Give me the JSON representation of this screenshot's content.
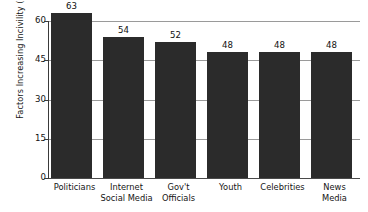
{
  "chart_data": {
    "type": "bar",
    "title": "",
    "subtitle": "",
    "xlabel": "",
    "ylabel": "Factors Increasing Incivility (%)",
    "categories": [
      "Politicians",
      "Internet Social Media",
      "Gov't Officials",
      "Youth",
      "Celebrities",
      "News Media"
    ],
    "category_lines": [
      [
        "Politicians"
      ],
      [
        "Internet",
        "Social Media"
      ],
      [
        "Gov't",
        "Officials"
      ],
      [
        "Youth"
      ],
      [
        "Celebrities"
      ],
      [
        "News",
        "Media"
      ]
    ],
    "values": [
      63,
      54,
      52,
      48,
      48,
      48
    ],
    "value_labels": [
      "63",
      "54",
      "52",
      "48",
      "48",
      "48"
    ],
    "ylim": [
      0,
      60
    ],
    "yticks": [
      60,
      45,
      30,
      15,
      0
    ],
    "ytick_labels": [
      "60",
      "45",
      "30",
      "15",
      "0"
    ],
    "grid": true,
    "legend": "none",
    "bar_color": "#2b2b2b",
    "gridline_color": "#9a9a9a",
    "axis_color": "#3a3a3a",
    "background_color": "#ffffff"
  }
}
